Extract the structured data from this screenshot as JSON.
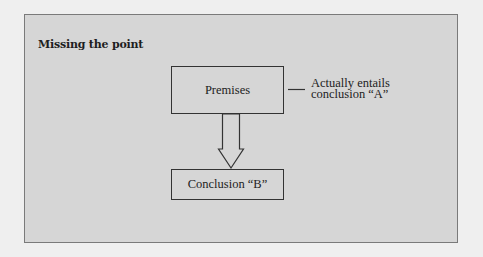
{
  "diagram": {
    "title": "Missing the point",
    "nodes": {
      "premises": {
        "label": "Premises"
      },
      "conclusion": {
        "label": "Conclusion “B”"
      }
    },
    "annotation": {
      "target": "premises",
      "lines": [
        "Actually entails",
        "conclusion “A”"
      ]
    },
    "edges": [
      {
        "from": "premises",
        "to": "conclusion",
        "style": "hollow-block-arrow"
      }
    ],
    "colors": {
      "background": "#efefef",
      "panel": "#d6d6d6",
      "stroke": "#333333",
      "text": "#222222"
    }
  }
}
